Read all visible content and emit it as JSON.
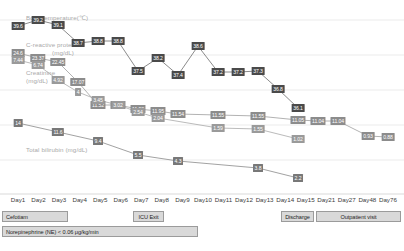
{
  "axis_titles": {
    "temperature": "Body temperature(℃)",
    "crp": "C-reactive protein",
    "crp_unit": "(mg/dL)",
    "creatinine": "Creatinine",
    "creatinine_unit": "(mg/dL)",
    "bilirubin": "Total bilirubin (mg/dL)"
  },
  "chart_data": {
    "type": "line",
    "title": "",
    "xlabel": "",
    "ylabel": "",
    "grid": true,
    "legend_position": "inline-left",
    "categories": [
      "Day1",
      "Day2",
      "Day3",
      "Day4",
      "Day5",
      "Day6",
      "Day7",
      "Day8",
      "Day9",
      "Day10",
      "Day11",
      "Day12",
      "Day13",
      "Day14",
      "Day15",
      "Day21",
      "Day27",
      "Day48",
      "Day76"
    ],
    "series": [
      {
        "name": "Body temperature(℃)",
        "unit": "℃",
        "color": "#4a4a4a",
        "x": [
          "Day1",
          "Day2",
          "Day3",
          "Day4",
          "Day5",
          "Day6",
          "Day7",
          "Day8",
          "Day9",
          "Day10",
          "Day11",
          "Day12",
          "Day13",
          "Day14",
          "Day15"
        ],
        "values": [
          39.6,
          39.2,
          39.1,
          38.7,
          38.8,
          38.8,
          37.5,
          38.2,
          37.4,
          38.6,
          37.2,
          37.2,
          37.3,
          36.8,
          36.1
        ]
      },
      {
        "name": "C-reactive protein (mg/dL)",
        "unit": "mg/dL",
        "color": "#8c8c8c",
        "x": [
          "Day1",
          "Day2",
          "Day3",
          "Day4",
          "Day5",
          "Day6",
          "Day7",
          "Day8",
          "Day9",
          "Day11",
          "Day13",
          "Day15",
          "Day21",
          "Day27",
          "Day48",
          "Day76"
        ],
        "values": [
          24.6,
          23.37,
          22.45,
          17.07,
          11.52,
          11.52,
          11.92,
          11.95,
          11.54,
          11.55,
          11.55,
          11.05,
          11.04,
          11.04,
          0.93,
          0.88
        ]
      },
      {
        "name": "Creatinine (mg/dL)",
        "unit": "mg/dL",
        "color": "#9a9a9a",
        "x": [
          "Day1",
          "Day2",
          "Day3",
          "Day4",
          "Day5",
          "Day6",
          "Day7",
          "Day8",
          "Day11",
          "Day13",
          "Day15"
        ],
        "values": [
          7.44,
          6.74,
          4.92,
          4.0,
          3.45,
          3.02,
          2.54,
          2.04,
          1.59,
          1.55,
          1.02
        ]
      },
      {
        "name": "Total bilirubin (mg/dL)",
        "unit": "mg/dL",
        "color": "#787878",
        "x": [
          "Day1",
          "Day3",
          "Day5",
          "Day7",
          "Day9",
          "Day13",
          "Day15"
        ],
        "values": [
          14.0,
          11.6,
          9.4,
          5.5,
          4.3,
          3.8,
          2.2
        ]
      }
    ]
  },
  "annotations": {
    "row1": [
      {
        "label": "Cefotiam",
        "align": "left"
      },
      {
        "label": "ICU Exit",
        "align": "center"
      },
      {
        "label": "Discharge",
        "align": "center"
      },
      {
        "label": "Outpatient visit",
        "align": "center"
      }
    ],
    "row2": [
      {
        "label": "Norepinephrine (NE) < 0.06 μg/kg/min",
        "align": "left"
      }
    ]
  }
}
